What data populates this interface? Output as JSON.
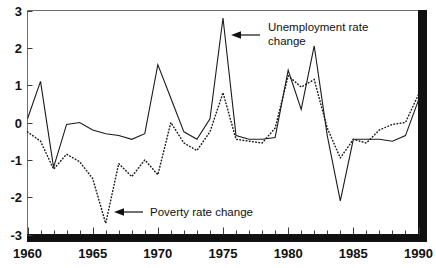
{
  "chart_data": {
    "type": "line",
    "title": "",
    "subtitle": "",
    "xlabel": "",
    "ylabel": "",
    "xlim": [
      1960,
      1990
    ],
    "ylim": [
      -3,
      3
    ],
    "grid": false,
    "legend_position": "inline-annotations",
    "x": [
      1960,
      1961,
      1962,
      1963,
      1964,
      1965,
      1966,
      1967,
      1968,
      1969,
      1970,
      1971,
      1972,
      1973,
      1974,
      1975,
      1976,
      1977,
      1978,
      1979,
      1980,
      1981,
      1982,
      1983,
      1984,
      1985,
      1986,
      1987,
      1988,
      1989,
      1990
    ],
    "x_tick_labels": [
      "1960",
      "1965",
      "1970",
      "1975",
      "1980",
      "1985",
      "1990"
    ],
    "x_tick_values": [
      1960,
      1965,
      1970,
      1975,
      1980,
      1985,
      1990
    ],
    "y_tick_labels": [
      "3",
      "2",
      "1",
      "0",
      "-1",
      "-2",
      "-3"
    ],
    "y_tick_values": [
      3,
      2,
      1,
      0,
      -1,
      -2,
      -3
    ],
    "series": [
      {
        "name": "Unemployment rate change",
        "style": "solid",
        "values": [
          0.1,
          1.1,
          -1.2,
          -0.05,
          0.0,
          -0.2,
          -0.3,
          -0.35,
          -0.45,
          -0.3,
          1.55,
          0.65,
          -0.25,
          -0.45,
          0.1,
          2.8,
          -0.35,
          -0.45,
          -0.45,
          -0.4,
          1.4,
          0.35,
          2.05,
          -0.35,
          -2.1,
          -0.45,
          -0.45,
          -0.45,
          -0.5,
          -0.35,
          0.6
        ]
      },
      {
        "name": "Poverty rate change",
        "style": "dotted",
        "values": [
          -0.25,
          -0.5,
          -1.25,
          -0.85,
          -1.05,
          -1.5,
          -2.7,
          -1.1,
          -1.45,
          -1.0,
          -1.4,
          0.0,
          -0.55,
          -0.75,
          -0.25,
          0.8,
          -0.45,
          -0.5,
          -0.55,
          -0.15,
          1.25,
          0.95,
          1.15,
          -0.15,
          -0.95,
          -0.45,
          -0.55,
          -0.2,
          -0.05,
          0.0,
          0.75
        ]
      }
    ],
    "annotations": [
      {
        "id": "unemployment-annotation",
        "text_line1": "Unemployment rate",
        "text_line2": "change",
        "arrow": "left-arrow"
      },
      {
        "id": "poverty-annotation",
        "text_line1": "Poverty rate change",
        "text_line2": "",
        "arrow": "left-arrow"
      }
    ]
  },
  "caption": {
    "text": ""
  }
}
